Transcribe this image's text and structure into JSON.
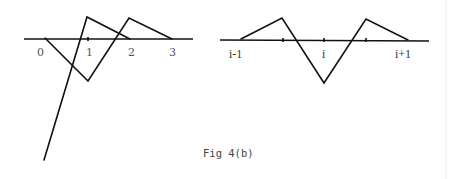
{
  "figure": {
    "caption": "Fig 4(b)",
    "left_panel": {
      "tick_labels": [
        "0",
        "1",
        "2",
        "3"
      ]
    },
    "right_panel": {
      "tick_labels": [
        "i-1",
        "i",
        "i+1"
      ]
    }
  }
}
